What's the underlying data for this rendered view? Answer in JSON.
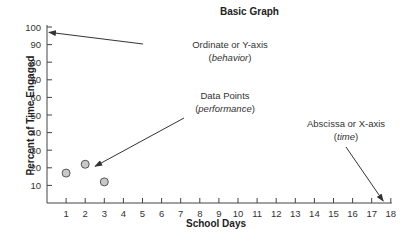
{
  "chart_data": {
    "type": "scatter",
    "title": "Basic Graph",
    "xlabel": "School Days",
    "ylabel": "Percent of Time Engaged",
    "x": [
      1,
      2,
      3
    ],
    "values": [
      17,
      22,
      12
    ],
    "xlim": [
      0,
      18
    ],
    "ylim": [
      0,
      100
    ],
    "x_ticks": [
      1,
      2,
      3,
      4,
      5,
      6,
      7,
      8,
      9,
      10,
      11,
      12,
      13,
      14,
      15,
      16,
      17,
      18
    ],
    "y_ticks": [
      10,
      20,
      30,
      40,
      50,
      60,
      70,
      80,
      90,
      100
    ],
    "grid": false,
    "legend": "none",
    "annotations": [
      {
        "text": "Ordinate or Y-axis",
        "subtext": "behavior",
        "points_to": "y-axis near 97"
      },
      {
        "text": "Data Points",
        "subtext": "performance",
        "points_to": "data point at x=2"
      },
      {
        "text": "Abscissa or X-axis",
        "subtext": "time",
        "points_to": "x-axis near 17.6"
      }
    ]
  },
  "labels": {
    "title": "Basic Graph",
    "xlabel": "School Days",
    "ylabel": "Percent of Time Engaged",
    "ordinate": "Ordinate or Y-axis",
    "ordinate_sub": "behavior",
    "datapoints": "Data Points",
    "datapoints_sub": "performance",
    "abscissa": "Abscissa or X-axis",
    "abscissa_sub": "time"
  }
}
